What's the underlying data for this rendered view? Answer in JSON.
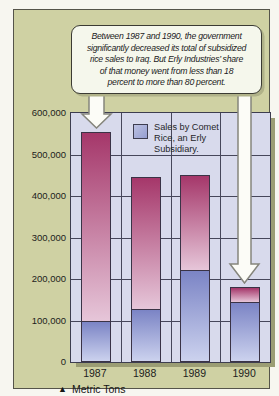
{
  "callout": {
    "text": "Between 1987 and 1990, the government significantly decreased its total of subsidized rice sales to Iraq. But Erly Industries’ share of that money went from less than 18 percent to more than 80 percent.",
    "lines": [
      "Between 1987 and 1990, the government",
      "significantly decreased its total of subsidized",
      "rice sales to Iraq. But Erly Industries’ share",
      "of that money went from less than 18",
      "percent to more than 80 percent."
    ]
  },
  "legend": {
    "label": "Sales by Comet Rice, an Erly Subsidiary.",
    "lines": [
      "Sales by Comet",
      "Rice, an Erly",
      "Subsidiary."
    ]
  },
  "footer": {
    "marker": "▲",
    "label": "Metric Tons"
  },
  "colors": {
    "card_bg": "#cfd1a3",
    "callout_bg": "#f5f7ec",
    "plot_bg": "#d8daec",
    "grid": "#46465a",
    "bar_border": "#3a3346",
    "magenta_top": "#a5376a",
    "magenta_bottom": "#e6c6d9",
    "blue_top": "#7b84c5",
    "blue_bottom": "#ccd2ee",
    "shadow": "#9b9d74",
    "arrow_fill": "#fcfcf7",
    "arrow_stroke": "#85857c"
  },
  "chart_data": {
    "type": "bar",
    "stacked": true,
    "title": "",
    "xlabel": "",
    "ylabel": "Metric Tons",
    "categories": [
      "1987",
      "1988",
      "1989",
      "1990"
    ],
    "series": [
      {
        "name": "Sales by Comet Rice, an Erly Subsidiary.",
        "color_key": "blue",
        "values": [
          95000,
          125000,
          220000,
          145000
        ]
      },
      {
        "name": "Other subsidized rice sales to Iraq",
        "color_key": "magenta",
        "values": [
          460000,
          320000,
          230000,
          35000
        ]
      }
    ],
    "totals": [
      555000,
      445000,
      450000,
      180000
    ],
    "ylim": [
      0,
      600000
    ],
    "y_ticks": [
      {
        "value": 0,
        "label": "0"
      },
      {
        "value": 100000,
        "label": "100,000"
      },
      {
        "value": 200000,
        "label": "200,000"
      },
      {
        "value": 300000,
        "label": "300,000"
      },
      {
        "value": 400000,
        "label": "400,000"
      },
      {
        "value": 500000,
        "label": "500,000"
      },
      {
        "value": 600000,
        "label": "600,000"
      }
    ],
    "grid": true,
    "legend_position": "inside-top",
    "annotations": [
      {
        "target": "1987",
        "type": "down-arrow"
      },
      {
        "target": "1990",
        "type": "down-arrow"
      }
    ]
  }
}
